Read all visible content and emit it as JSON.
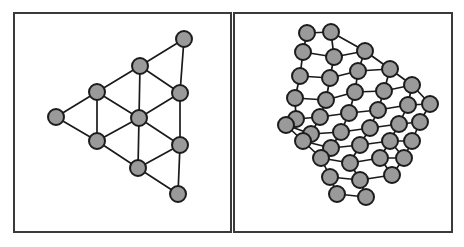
{
  "figure": {
    "title": "",
    "background_color": "#ffffff",
    "frame_color": "#3a3a3a",
    "node_fill_color": "#9a9a9a",
    "node_stroke_color": "#1c1c1c",
    "edge_color": "#1a1a1a",
    "panel_count": 2
  },
  "chart_data": {
    "type": "diagram",
    "title": "",
    "xlabel": "",
    "ylabel": "",
    "layout": "two side-by-side framed panels, each containing an undirected triangular-lattice graph of filled gray circular nodes joined by straight black edges",
    "panels": [
      {
        "name": "left-panel",
        "label": "",
        "frame": {
          "x": 14,
          "y": 13,
          "width": 217,
          "height": 219
        },
        "node_radius": 8,
        "node_count": 10,
        "edge_count": 21,
        "description": "small triangular lattice graph, 10 nodes",
        "nodes": [
          {
            "id": 0,
            "x": 184,
            "y": 39
          },
          {
            "id": 1,
            "x": 140,
            "y": 66
          },
          {
            "id": 2,
            "x": 180,
            "y": 93
          },
          {
            "id": 3,
            "x": 97,
            "y": 92
          },
          {
            "id": 4,
            "x": 139,
            "y": 118
          },
          {
            "id": 5,
            "x": 56,
            "y": 117
          },
          {
            "id": 6,
            "x": 97,
            "y": 141
          },
          {
            "id": 7,
            "x": 180,
            "y": 145
          },
          {
            "id": 8,
            "x": 138,
            "y": 168
          },
          {
            "id": 9,
            "x": 178,
            "y": 194
          }
        ],
        "edges": [
          [
            0,
            1
          ],
          [
            0,
            2
          ],
          [
            1,
            2
          ],
          [
            1,
            3
          ],
          [
            1,
            4
          ],
          [
            2,
            4
          ],
          [
            2,
            7
          ],
          [
            3,
            4
          ],
          [
            3,
            5
          ],
          [
            3,
            6
          ],
          [
            4,
            6
          ],
          [
            4,
            7
          ],
          [
            4,
            8
          ],
          [
            5,
            6
          ],
          [
            6,
            8
          ],
          [
            7,
            8
          ],
          [
            7,
            9
          ],
          [
            8,
            9
          ],
          [
            2,
            0
          ],
          [
            1,
            0
          ],
          [
            6,
            4
          ]
        ]
      },
      {
        "name": "right-panel",
        "label": "",
        "frame": {
          "x": 234,
          "y": 13,
          "width": 218,
          "height": 219
        },
        "node_radius": 8,
        "node_count": 40,
        "edge_count": 88,
        "description": "larger rotated triangular lattice graph, 40 nodes",
        "nodes": [
          {
            "id": 0,
            "x": 307,
            "y": 33
          },
          {
            "id": 1,
            "x": 331,
            "y": 32
          },
          {
            "id": 2,
            "x": 303,
            "y": 52
          },
          {
            "id": 3,
            "x": 334,
            "y": 57
          },
          {
            "id": 4,
            "x": 365,
            "y": 51
          },
          {
            "id": 5,
            "x": 300,
            "y": 76
          },
          {
            "id": 6,
            "x": 330,
            "y": 78
          },
          {
            "id": 7,
            "x": 358,
            "y": 71
          },
          {
            "id": 8,
            "x": 390,
            "y": 69
          },
          {
            "id": 9,
            "x": 295,
            "y": 98
          },
          {
            "id": 10,
            "x": 326,
            "y": 100
          },
          {
            "id": 11,
            "x": 355,
            "y": 92
          },
          {
            "id": 12,
            "x": 384,
            "y": 91
          },
          {
            "id": 13,
            "x": 412,
            "y": 85
          },
          {
            "id": 14,
            "x": 296,
            "y": 119
          },
          {
            "id": 15,
            "x": 320,
            "y": 117
          },
          {
            "id": 16,
            "x": 349,
            "y": 113
          },
          {
            "id": 17,
            "x": 378,
            "y": 110
          },
          {
            "id": 18,
            "x": 408,
            "y": 105
          },
          {
            "id": 19,
            "x": 430,
            "y": 104
          },
          {
            "id": 20,
            "x": 286,
            "y": 125
          },
          {
            "id": 21,
            "x": 311,
            "y": 134
          },
          {
            "id": 22,
            "x": 341,
            "y": 132
          },
          {
            "id": 23,
            "x": 370,
            "y": 128
          },
          {
            "id": 24,
            "x": 399,
            "y": 124
          },
          {
            "id": 25,
            "x": 420,
            "y": 122
          },
          {
            "id": 26,
            "x": 303,
            "y": 141
          },
          {
            "id": 27,
            "x": 331,
            "y": 148
          },
          {
            "id": 28,
            "x": 360,
            "y": 145
          },
          {
            "id": 29,
            "x": 390,
            "y": 141
          },
          {
            "id": 30,
            "x": 412,
            "y": 141
          },
          {
            "id": 31,
            "x": 321,
            "y": 158
          },
          {
            "id": 32,
            "x": 350,
            "y": 163
          },
          {
            "id": 33,
            "x": 380,
            "y": 158
          },
          {
            "id": 34,
            "x": 404,
            "y": 158
          },
          {
            "id": 35,
            "x": 330,
            "y": 177
          },
          {
            "id": 36,
            "x": 360,
            "y": 180
          },
          {
            "id": 37,
            "x": 392,
            "y": 175
          },
          {
            "id": 38,
            "x": 337,
            "y": 194
          },
          {
            "id": 39,
            "x": 366,
            "y": 197
          }
        ],
        "edges": [
          [
            0,
            1
          ],
          [
            0,
            2
          ],
          [
            1,
            3
          ],
          [
            1,
            4
          ],
          [
            2,
            3
          ],
          [
            2,
            5
          ],
          [
            3,
            4
          ],
          [
            3,
            6
          ],
          [
            4,
            7
          ],
          [
            4,
            8
          ],
          [
            5,
            6
          ],
          [
            5,
            9
          ],
          [
            6,
            7
          ],
          [
            6,
            10
          ],
          [
            7,
            8
          ],
          [
            7,
            11
          ],
          [
            8,
            12
          ],
          [
            8,
            13
          ],
          [
            9,
            10
          ],
          [
            9,
            14
          ],
          [
            10,
            11
          ],
          [
            10,
            15
          ],
          [
            11,
            12
          ],
          [
            11,
            16
          ],
          [
            12,
            13
          ],
          [
            12,
            17
          ],
          [
            13,
            18
          ],
          [
            13,
            19
          ],
          [
            14,
            15
          ],
          [
            14,
            20
          ],
          [
            15,
            16
          ],
          [
            15,
            21
          ],
          [
            16,
            17
          ],
          [
            16,
            22
          ],
          [
            17,
            18
          ],
          [
            17,
            23
          ],
          [
            18,
            19
          ],
          [
            18,
            24
          ],
          [
            19,
            25
          ],
          [
            20,
            21
          ],
          [
            20,
            26
          ],
          [
            21,
            22
          ],
          [
            21,
            26
          ],
          [
            22,
            23
          ],
          [
            22,
            27
          ],
          [
            23,
            24
          ],
          [
            23,
            28
          ],
          [
            24,
            25
          ],
          [
            24,
            29
          ],
          [
            25,
            30
          ],
          [
            26,
            27
          ],
          [
            26,
            31
          ],
          [
            27,
            28
          ],
          [
            27,
            31
          ],
          [
            28,
            29
          ],
          [
            28,
            32
          ],
          [
            29,
            30
          ],
          [
            29,
            33
          ],
          [
            30,
            34
          ],
          [
            31,
            32
          ],
          [
            31,
            35
          ],
          [
            32,
            33
          ],
          [
            32,
            36
          ],
          [
            33,
            34
          ],
          [
            33,
            37
          ],
          [
            34,
            30
          ],
          [
            35,
            36
          ],
          [
            35,
            38
          ],
          [
            36,
            37
          ],
          [
            36,
            39
          ],
          [
            37,
            34
          ],
          [
            38,
            39
          ],
          [
            39,
            36
          ],
          [
            9,
            5
          ],
          [
            14,
            9
          ],
          [
            21,
            15
          ],
          [
            27,
            22
          ],
          [
            31,
            26
          ],
          [
            35,
            31
          ],
          [
            38,
            35
          ],
          [
            19,
            13
          ],
          [
            25,
            19
          ],
          [
            30,
            25
          ],
          [
            34,
            29
          ],
          [
            37,
            33
          ],
          [
            2,
            0
          ],
          [
            5,
            2
          ],
          [
            6,
            3
          ],
          [
            10,
            6
          ]
        ]
      }
    ]
  }
}
